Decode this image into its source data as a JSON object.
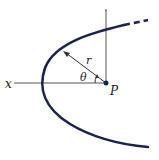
{
  "diagram": {
    "labels": {
      "axis": "x",
      "radius": "r",
      "angle": "θ",
      "point": "P"
    },
    "colors": {
      "curve": "#1c2350",
      "axis": "#555555",
      "text": "#222222"
    }
  }
}
